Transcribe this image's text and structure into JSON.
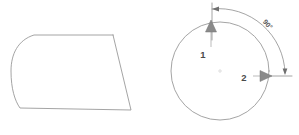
{
  "figure": {
    "canvas": {
      "width": 299,
      "height": 135,
      "background": "#ffffff"
    },
    "stroke_color": "#9a9a9a",
    "dimension_color": "#8d8d8d",
    "arrow_fill": "#8a8a8a",
    "label_color": "#4a4a4a",
    "left_shape": {
      "name": "rounded-left-quadrilateral",
      "path": "M 113 35 L 34 35 C 18 40 11 54 11 71 C 11 89 15 101 20 108 L 131 110 L 113 35 Z",
      "description": "closed outline with rounded left end and straight slanted right edge"
    },
    "right_shape": {
      "name": "circle-with-direction-vectors",
      "circle": {
        "cx": 220,
        "cy": 71,
        "r": 49
      },
      "center_mark": {
        "cx": 220,
        "cy": 71,
        "r": 1.2
      }
    },
    "vectors": [
      {
        "id": "vector-1",
        "label": "1",
        "label_x": 203,
        "label_y": 58,
        "direction": "up",
        "shaft": "M 211 47 L 211 30",
        "head": "M 211 20 L 216.5 32 L 205.5 32 Z"
      },
      {
        "id": "vector-2",
        "label": "2",
        "label_x": 244,
        "label_y": 81,
        "direction": "right",
        "shaft": "M 253 76 L 263 76",
        "head": "M 272 76 L 260 81.5 L 260 70.5 Z"
      }
    ],
    "dimension": {
      "angle_label": "90°",
      "angle_value": 90,
      "angle_unit": "degrees",
      "label_x": 266,
      "label_y": 26,
      "label_rotation": 48,
      "arc_path": "M 212 9 A 66 66 0 0 1 285 73",
      "extension_top": "M 212 3 L 212 40",
      "extension_right": "M 262 76 L 292 76",
      "arrowhead_top": "M 212 9 L 219 6.5 L 219 11.5 Z",
      "arrowhead_right": "M 285 75 L 282.6 68.5 L 287.4 68.5 Z"
    }
  }
}
